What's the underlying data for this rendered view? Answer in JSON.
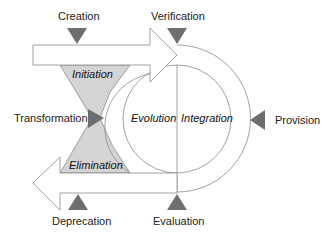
{
  "diagram": {
    "type": "lifecycle",
    "labels": {
      "creation": "Creation",
      "verification": "Verification",
      "transformation": "Transformation",
      "provision": "Provision",
      "deprecation": "Deprecation",
      "evaluation": "Evaluation"
    },
    "phases": {
      "initiation": "Initiation",
      "elimination": "Elimination",
      "evolution": "Evolution",
      "integration": "Integration"
    },
    "colors": {
      "marker": "#6e6e6e",
      "funnel_fill": "#d4d4d4",
      "stroke": "#8a8a8a",
      "background": "#ffffff"
    }
  }
}
